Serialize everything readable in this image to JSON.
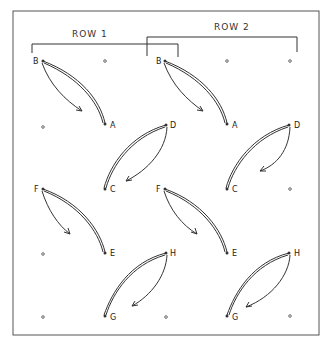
{
  "diagram": {
    "row_labels": [
      "ROW 1",
      "ROW 2"
    ],
    "points": [
      {
        "id": "r1-B",
        "label": "B",
        "col": 0,
        "row": 0
      },
      {
        "id": "r1-dot-top",
        "label": "",
        "col": 1,
        "row": 0,
        "col_half": true
      },
      {
        "id": "r1-dot-a",
        "label": "",
        "col": 0,
        "row": 1
      },
      {
        "id": "r1-A",
        "label": "A",
        "col": 1,
        "row": 1
      },
      {
        "id": "r1-D",
        "label": "D",
        "col": 2,
        "row": 1,
        "shift": "left"
      },
      {
        "id": "r1-F",
        "label": "F",
        "col": 0,
        "row": 2
      },
      {
        "id": "r1-C",
        "label": "C",
        "col": 1,
        "row": 2
      },
      {
        "id": "r1-dot-e",
        "label": "",
        "col": 0,
        "row": 3
      },
      {
        "id": "r1-E",
        "label": "E",
        "col": 1,
        "row": 3
      },
      {
        "id": "r1-H",
        "label": "H",
        "col": 2,
        "row": 3
      },
      {
        "id": "r1-dot-g",
        "label": "",
        "col": 0,
        "row": 4
      },
      {
        "id": "r1-G",
        "label": "G",
        "col": 1,
        "row": 4
      },
      {
        "id": "r2-B",
        "label": "B",
        "col": 2,
        "row": 0
      },
      {
        "id": "r2-A",
        "label": "A",
        "col": 3,
        "row": 1
      },
      {
        "id": "r2-D",
        "label": "D",
        "col": 4,
        "row": 1
      },
      {
        "id": "r2-F",
        "label": "F",
        "col": 2,
        "row": 2
      },
      {
        "id": "r2-C",
        "label": "C",
        "col": 3,
        "row": 2
      },
      {
        "id": "r2-E",
        "label": "E",
        "col": 3,
        "row": 3
      },
      {
        "id": "r2-H",
        "label": "H",
        "col": 4,
        "row": 3
      },
      {
        "id": "r2-G",
        "label": "G",
        "col": 3,
        "row": 4
      }
    ],
    "moves": [
      {
        "from": "B",
        "to": "A",
        "group": "row1"
      },
      {
        "from": "D",
        "to": "C",
        "group": "row1"
      },
      {
        "from": "F",
        "to": "E",
        "group": "row1"
      },
      {
        "from": "H",
        "to": "G",
        "group": "row1"
      },
      {
        "from": "B",
        "to": "A",
        "group": "row2"
      },
      {
        "from": "D",
        "to": "C",
        "group": "row2"
      },
      {
        "from": "F",
        "to": "E",
        "group": "row2"
      },
      {
        "from": "H",
        "to": "G",
        "group": "row2"
      }
    ]
  },
  "labels": {
    "row1": "ROW 1",
    "row2": "ROW 2",
    "r1": {
      "B": "B",
      "A": "A",
      "D": "D",
      "C": "C",
      "F": "F",
      "E": "E",
      "H": "H",
      "G": "G"
    },
    "r2": {
      "B": "B",
      "A": "A",
      "D": "D",
      "C": "C",
      "F": "F",
      "E": "E",
      "H": "H",
      "G": "G"
    }
  }
}
